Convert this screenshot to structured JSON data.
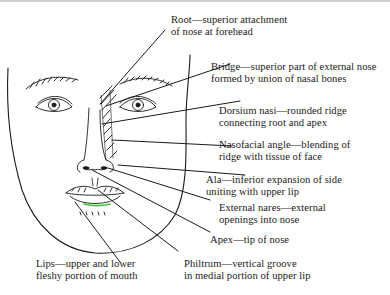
{
  "figure": {
    "accent_color": "#3ec63e",
    "labels": [
      {
        "id": "root",
        "line1": "Root—superior attachment",
        "line2": "of nose at forehead"
      },
      {
        "id": "bridge",
        "line1": "Bridge—superior part of external nose",
        "line2": "formed by union of nasal bones"
      },
      {
        "id": "dorsum",
        "line1": "Dorsium nasi—rounded ridge",
        "line2": "connecting root and apex"
      },
      {
        "id": "nasofacial",
        "line1": "Nasofacial angle—blending of",
        "line2": "ridge with tissue of face"
      },
      {
        "id": "ala",
        "line1": "Ala—inferior expansion of side",
        "line2": "uniting with upper lip"
      },
      {
        "id": "nares",
        "line1": "External nares—external",
        "line2": "openings into nose"
      },
      {
        "id": "apex",
        "line1": "Apex—tip of nose"
      },
      {
        "id": "lips",
        "line1": "Lips—upper and lower",
        "line2": "fleshy portion of mouth"
      },
      {
        "id": "philtrum",
        "line1": "Philtrum—vertical groove",
        "line2": "in medial portion of upper lip"
      }
    ]
  }
}
